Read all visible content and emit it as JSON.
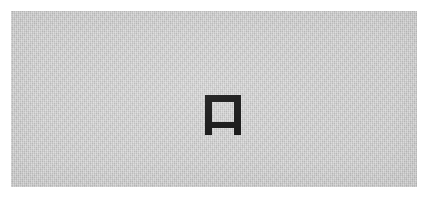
{
  "canvas": {
    "width": 430,
    "height": 197,
    "background_color": "#ffffff"
  },
  "panel": {
    "label": "scanned background panel",
    "background_color": "#c9c9c9",
    "texture": "dithered-noise",
    "left": 11,
    "top": 11,
    "width": 406,
    "height": 176
  },
  "glyph": {
    "name": "bench-square-glyph",
    "description": "thick black square outline with hollow center and two short downward feet separated by a gap in the bottom bar",
    "unicode_lookalike": "⊓",
    "stroke_color": "#121212",
    "fill_color": "#c9c9c9",
    "left": 194,
    "top": 84,
    "width": 36,
    "height": 40,
    "stroke_width": 6
  },
  "content": {
    "text": "",
    "note": ""
  }
}
